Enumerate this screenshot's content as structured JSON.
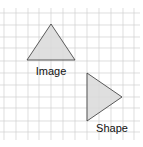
{
  "figure": {
    "grid": {
      "spacing": 12,
      "color": "#d0d0d0",
      "x_lines": [
        4,
        16,
        28,
        39,
        51,
        63,
        75,
        87,
        99,
        111,
        123,
        134
      ],
      "y_lines": [
        13,
        25,
        37,
        48,
        61,
        73,
        85,
        97,
        108,
        121,
        132
      ]
    },
    "shapes": [
      {
        "name": "image",
        "label": "Image",
        "points": "51,24 27,60 75,60",
        "fill": "#d9d9d9",
        "stroke": "#333333",
        "label_x": 51,
        "label_y": 75
      },
      {
        "name": "shape",
        "label": "Shape",
        "points": "87,73 87,121 122,97",
        "fill": "#d9d9d9",
        "stroke": "#333333",
        "label_x": 112,
        "label_y": 132
      }
    ]
  }
}
